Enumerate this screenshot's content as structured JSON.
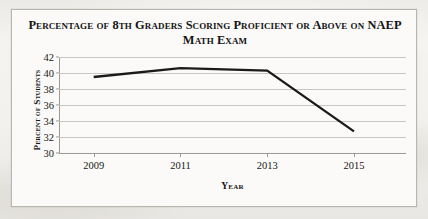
{
  "document": {
    "background_color": "#efeeea",
    "page_color": "#fbfaf8"
  },
  "chart_data": {
    "type": "line",
    "title": "Percentage of 8th Graders Scoring Proficient or Above on NAEP Math Exam",
    "title_lines": [
      "Percentage of 8th Graders Scoring Proficient or Above on NAEP",
      "Math Exam"
    ],
    "xlabel": "Year",
    "ylabel": "Percent of Students",
    "x": [
      2009,
      2011,
      2013,
      2015
    ],
    "categories": [
      "2009",
      "2011",
      "2013",
      "2015"
    ],
    "values": [
      39.5,
      40.6,
      40.3,
      32.7
    ],
    "series": [
      {
        "name": "Percent Proficient or Above",
        "values": [
          39.5,
          40.6,
          40.3,
          32.7
        ],
        "color": "#1a1a1a",
        "line_width": 2.3
      }
    ],
    "ylim": [
      30,
      42
    ],
    "xlim": [
      2008.2,
      2016.2
    ],
    "y_ticks": [
      30,
      32,
      34,
      36,
      38,
      40,
      42
    ],
    "y_tick_labels": [
      "30",
      "32",
      "34",
      "36",
      "38",
      "40",
      "42"
    ],
    "x_ticks": [
      2009,
      2011,
      2013,
      2015
    ],
    "x_tick_labels": [
      "2009",
      "2011",
      "2013",
      "2015"
    ],
    "grid": true,
    "grid_axis": "y",
    "grid_color": "#c8c6c2",
    "legend": false,
    "legend_position": "none",
    "markers": false,
    "border": true,
    "border_color": "#b9b6b1"
  }
}
